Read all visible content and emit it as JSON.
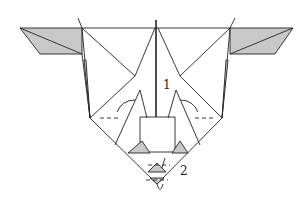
{
  "diagram": {
    "type": "origami-step",
    "step_labels": [
      {
        "id": "1",
        "text": "1",
        "x": 163,
        "y": 84
      },
      {
        "id": "2",
        "text": "2",
        "x": 180,
        "y": 167
      }
    ],
    "colors": {
      "line": "#222222",
      "shade": "#c8c8c8",
      "paper": "#ffffff"
    }
  }
}
